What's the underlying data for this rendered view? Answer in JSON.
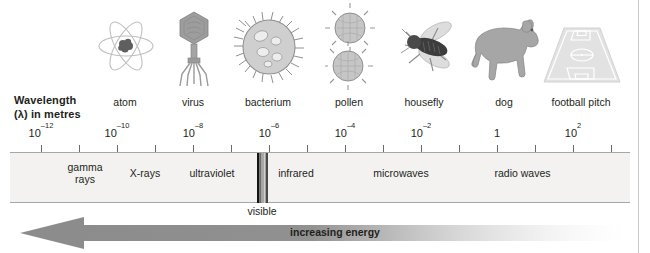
{
  "figure": {
    "wavelength_heading_line1": "Wavelength",
    "wavelength_heading_line2": "(λ) in metres",
    "energy_arrow_label": "increasing energy",
    "visible_caption": "visible"
  },
  "objects": [
    {
      "label": "atom",
      "icon": "atom-icon",
      "x": 125
    },
    {
      "label": "virus",
      "icon": "virus-icon",
      "x": 193
    },
    {
      "label": "bacterium",
      "icon": "bacterium-icon",
      "x": 268
    },
    {
      "label": "pollen",
      "icon": "pollen-icon",
      "x": 349
    },
    {
      "label": "housefly",
      "icon": "housefly-icon",
      "x": 424
    },
    {
      "label": "dog",
      "icon": "dog-icon",
      "x": 504
    },
    {
      "label": "football pitch",
      "icon": "football-pitch-icon",
      "x": 581
    }
  ],
  "axis": {
    "tick_labels": [
      {
        "mantissa": "10",
        "exponent": "–12",
        "x": 41
      },
      {
        "mantissa": "10",
        "exponent": "–10",
        "x": 117
      },
      {
        "mantissa": "10",
        "exponent": "–8",
        "x": 193
      },
      {
        "mantissa": "10",
        "exponent": "–6",
        "x": 269
      },
      {
        "mantissa": "10",
        "exponent": "–4",
        "x": 345
      },
      {
        "mantissa": "10",
        "exponent": "–2",
        "x": 421
      },
      {
        "mantissa": "1",
        "exponent": "",
        "x": 497
      },
      {
        "mantissa": "10",
        "exponent": "2",
        "x": 573
      }
    ],
    "tick_marks_x": [
      41,
      79,
      117,
      155,
      193,
      231,
      269,
      307,
      345,
      383,
      421,
      459,
      497,
      535,
      573,
      611
    ]
  },
  "bands": [
    {
      "label": "gamma\nrays",
      "name": "gamma-rays",
      "x": 85,
      "two_line": true
    },
    {
      "label": "X-rays",
      "name": "x-rays",
      "x": 145,
      "two_line": false
    },
    {
      "label": "ultraviolet",
      "name": "ultraviolet",
      "x": 212,
      "two_line": false
    },
    {
      "label": "infrared",
      "name": "infrared",
      "x": 296,
      "two_line": false
    },
    {
      "label": "microwaves",
      "name": "microwaves",
      "x": 401,
      "two_line": false
    },
    {
      "label": "radio waves",
      "name": "radio-waves",
      "x": 522,
      "two_line": false
    }
  ],
  "visible_band": {
    "x": 257,
    "width": 11,
    "caption_x": 262
  },
  "colors": {
    "band_fill": "#f3f2f0",
    "axis_line": "#a8a6a4",
    "text": "#231f20",
    "arrow_dark": "#8c8c8c",
    "illustration_gray": "#a9a9a9"
  }
}
